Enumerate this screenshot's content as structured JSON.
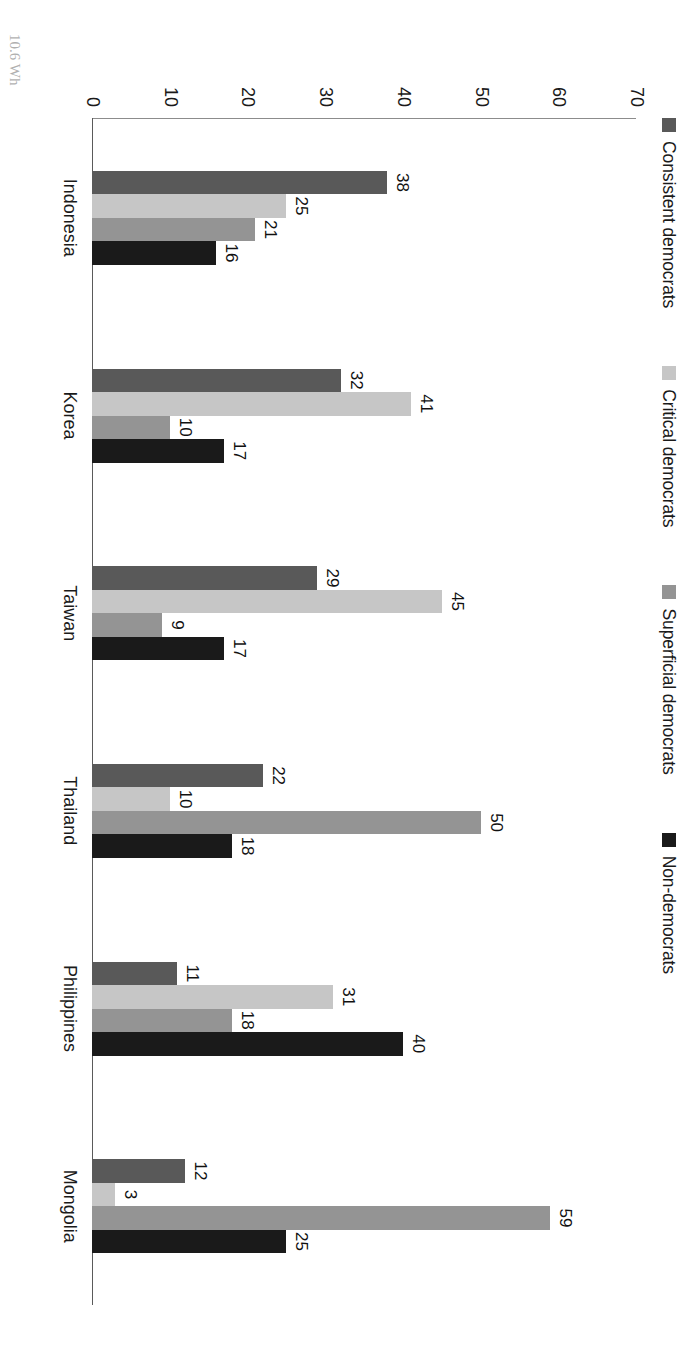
{
  "chart_data": {
    "type": "bar",
    "title": "",
    "subtitle": "",
    "xlabel": "",
    "ylabel": "",
    "ylim": [
      0,
      70
    ],
    "yticks": [
      "0",
      "10",
      "20",
      "30",
      "40",
      "50",
      "60",
      "70"
    ],
    "grid": false,
    "legend_position": "top",
    "orientation": "rotated-90",
    "categories": [
      "Indonesia",
      "Korea",
      "Taiwan",
      "Thailand",
      "Philippines",
      "Mongolia"
    ],
    "series": [
      {
        "name": "Consistent democrats",
        "color": "#595959",
        "values": [
          38,
          32,
          29,
          22,
          11,
          12
        ],
        "labels": [
          "38",
          "32",
          "29",
          "22",
          "11",
          "12"
        ]
      },
      {
        "name": "Critical democrats",
        "color": "#c6c6c6",
        "values": [
          25,
          41,
          45,
          10,
          31,
          3
        ],
        "labels": [
          "25",
          "41",
          "45",
          "10",
          "31",
          "3"
        ]
      },
      {
        "name": "Superficial democrats",
        "color": "#949494",
        "values": [
          21,
          10,
          9,
          50,
          18,
          59
        ],
        "labels": [
          "21",
          "10",
          "9",
          "50",
          "18",
          "59"
        ]
      },
      {
        "name": "Non-democrats",
        "color": "#1a1a1a",
        "values": [
          16,
          17,
          17,
          18,
          40,
          25
        ],
        "labels": [
          "16",
          "17",
          "17",
          "18",
          "40",
          "25"
        ]
      }
    ]
  },
  "caption": "10.6 Wh"
}
